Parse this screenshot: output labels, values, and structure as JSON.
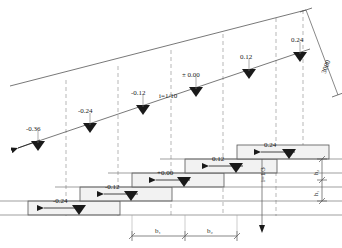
{
  "drawing": {
    "title": "Stepped foundation / sloped ground section",
    "type": "engineering-section",
    "units": "mm",
    "line_color": "#555555",
    "fill_color": "#f2f2f2",
    "marker_color": "#1a1a1a"
  },
  "ground_line_levels": [
    {
      "id": "g1",
      "label": "-0.36",
      "x": 38,
      "y": 140
    },
    {
      "id": "g2",
      "label": "-0.24",
      "x": 90,
      "y": 122
    },
    {
      "id": "g3",
      "label": "-0.12",
      "x": 143,
      "y": 104
    },
    {
      "id": "g4",
      "label": "± 0.00",
      "x": 196,
      "y": 86
    },
    {
      "id": "g5",
      "label": "0.12",
      "x": 249,
      "y": 68
    },
    {
      "id": "g6",
      "label": "0.24",
      "x": 300,
      "y": 51
    }
  ],
  "step_levels": [
    {
      "id": "s1",
      "label": "-0.24",
      "x": 118,
      "y": 204
    },
    {
      "id": "s2",
      "label": "-0.12",
      "x": 170,
      "y": 190
    },
    {
      "id": "s3",
      "label": "+0.00",
      "x": 222,
      "y": 176
    },
    {
      "id": "s4",
      "label": "0.12",
      "x": 274,
      "y": 162
    },
    {
      "id": "s5",
      "label": "0.24",
      "x": 318,
      "y": 150
    }
  ],
  "slope_labels": {
    "upper": "i=1/10",
    "lower": "i=1/3"
  },
  "dimensions": {
    "diagonal": "3000",
    "horizontal": [
      {
        "id": "b1",
        "label": "b₁"
      },
      {
        "id": "b2",
        "label": "b₂"
      }
    ],
    "vertical": [
      {
        "id": "h2",
        "label": "h₂"
      },
      {
        "id": "h1",
        "label": "h₁"
      }
    ]
  }
}
